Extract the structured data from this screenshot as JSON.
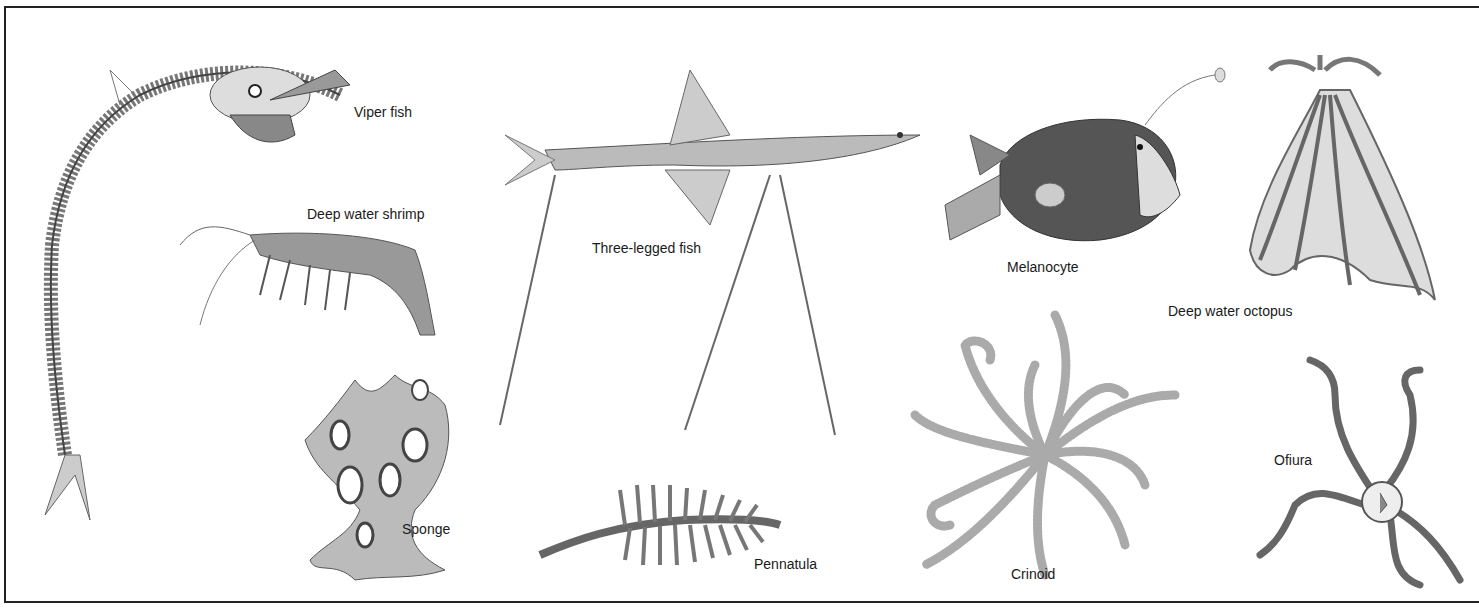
{
  "plate": {
    "border_color": "#222222",
    "background": "#ffffff"
  },
  "labels": {
    "viper_fish": "Viper fish",
    "deep_water_shrimp": "Deep water shrimp",
    "three_legged_fish": "Three-legged fish",
    "melanocyte": "Melanocyte",
    "deep_water_octopus": "Deep water octopus",
    "sponge": "Sponge",
    "pennatula": "Pennatula",
    "crinoid": "Crinoid",
    "ofiura": "Ofiura"
  }
}
